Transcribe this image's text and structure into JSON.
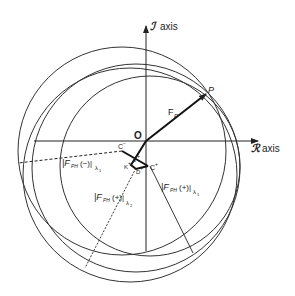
{
  "axes": {
    "imag_label_symbol": "ℐ",
    "imag_label_text": "axis",
    "real_label_symbol": "ℛ",
    "real_label_text": "axis"
  },
  "points": {
    "origin": "O",
    "p": "P",
    "c_minus": "C",
    "c_minus_sup": "−",
    "c_plus": "C",
    "c_plus_sup": "+",
    "j_plus": "J",
    "j_plus_sup": "+",
    "k_plus": "K",
    "k_plus_sup": "+",
    "d_plus": "D",
    "d_plus_sup": "+"
  },
  "vectors": {
    "fp_main": "F",
    "fp_sub": "P"
  },
  "labels": {
    "fph_minus_l1": {
      "main": "|F",
      "sub": "PH",
      "mid": "(−)|",
      "lambda": "λ",
      "lambda_sub": "1"
    },
    "fph_plus_l2": {
      "main": "|F",
      "sub": "PH",
      "mid": "(+)|",
      "lambda": "λ",
      "lambda_sub": "2"
    },
    "fph_plus_l1": {
      "main": "|F",
      "sub": "PH",
      "mid": "(+)|",
      "lambda": "λ",
      "lambda_sub": "1"
    }
  },
  "colors": {
    "stroke": "#222222",
    "background": "#ffffff"
  }
}
